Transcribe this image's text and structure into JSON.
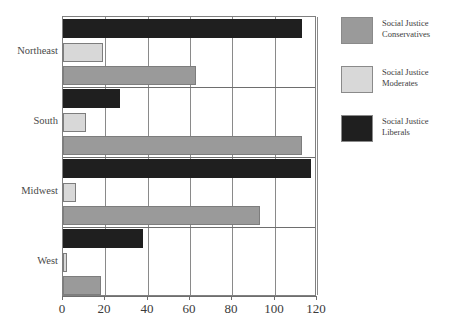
{
  "chart_data": {
    "type": "bar",
    "orientation": "horizontal",
    "title": "",
    "subtitle": "",
    "xlabel": "",
    "ylabel": "",
    "categories": [
      "Northeast",
      "South",
      "Midwest",
      "West"
    ],
    "series": [
      {
        "name": "Social Justice Conservatives",
        "color": "#9a9a9a",
        "values": [
          63,
          113,
          93,
          18
        ]
      },
      {
        "name": "Social Justice Moderates",
        "color": "#d8d8d8",
        "values": [
          19,
          11,
          6,
          2
        ]
      },
      {
        "name": "Social Justice Liberals",
        "color": "#1f1f1f",
        "values": [
          113,
          27,
          117,
          38
        ]
      }
    ],
    "series_order_in_group_top_to_bottom": [
      "Social Justice Liberals",
      "Social Justice Moderates",
      "Social Justice Conservatives"
    ],
    "xlim": [
      0,
      120
    ],
    "xticks": [
      0,
      20,
      40,
      60,
      80,
      100,
      120
    ],
    "xtick_labels": [
      "0",
      "20",
      "40",
      "60",
      "80",
      "100",
      "120"
    ],
    "grid": "vertical",
    "legend_position": "right"
  },
  "legend": {
    "items": [
      {
        "label_line1": "Social Justice",
        "label_line2": "Conservatives",
        "swatch": "#9a9a9a"
      },
      {
        "label_line1": "Social Justice",
        "label_line2": "Moderates",
        "swatch": "#d8d8d8"
      },
      {
        "label_line1": "Social Justice",
        "label_line2": "Liberals",
        "swatch": "#1f1f1f"
      }
    ]
  },
  "axis": {
    "x_tick_labels": [
      "0",
      "20",
      "40",
      "60",
      "80",
      "100",
      "120"
    ],
    "category_labels": [
      "Northeast",
      "South",
      "Midwest",
      "West"
    ]
  },
  "colors": {
    "conservatives": "#9a9a9a",
    "moderates": "#d8d8d8",
    "liberals": "#1f1f1f",
    "grid": "#8a8a8a",
    "frame": "#808080",
    "text": "#3a3a3a",
    "background": "#ffffff"
  }
}
